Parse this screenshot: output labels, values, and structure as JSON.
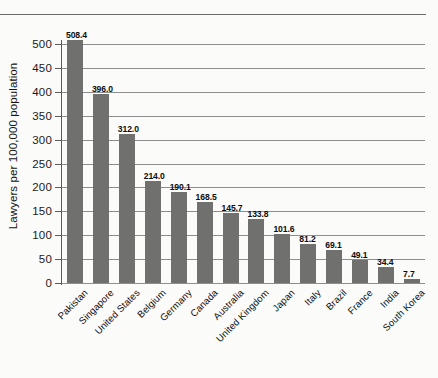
{
  "figure": {
    "background_color": "#fbfbfa",
    "rule_color": "#6a6a6a",
    "bar_color": "#70706f",
    "gridline_color": "#8e8e8e",
    "axis_color": "#5a5a5a"
  },
  "chart_data": {
    "type": "bar",
    "title": "",
    "xlabel": "",
    "ylabel": "Lawyers per 100,000 population",
    "ylim": [
      0,
      500
    ],
    "ytick_step": 50,
    "yticks": [
      "0",
      "50",
      "100",
      "150",
      "200",
      "250",
      "300",
      "350",
      "400",
      "450",
      "500"
    ],
    "grid": true,
    "legend": false,
    "value_label_format": "one-decimal",
    "categories": [
      "Pakistan",
      "Singapore",
      "United States",
      "Belgium",
      "Germany",
      "Canada",
      "Australia",
      "United Kingdom",
      "Japan",
      "Italy",
      "Brazil",
      "France",
      "India",
      "South Korea"
    ],
    "values": [
      508.4,
      396.0,
      312.0,
      214.0,
      190.1,
      168.5,
      145.7,
      133.8,
      101.6,
      81.2,
      69.1,
      49.1,
      34.4,
      7.7
    ],
    "value_labels": [
      "508.4",
      "396.0",
      "312.0",
      "214.0",
      "190.1",
      "168.5",
      "145.7",
      "133.8",
      "101.6",
      "81.2",
      "69.1",
      "49.1",
      "34.4",
      "7.7"
    ]
  }
}
